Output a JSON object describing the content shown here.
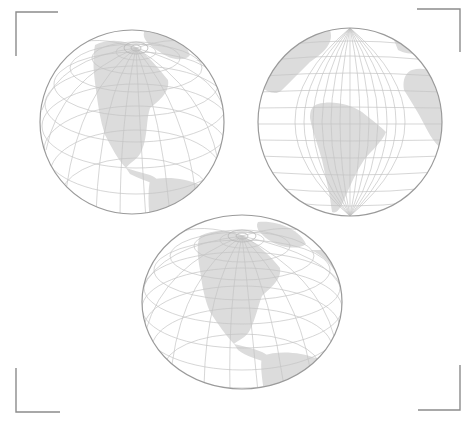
{
  "figure": {
    "colors": {
      "background": "#ffffff",
      "land": "#dcdcdc",
      "graticule": "#c4c4c4",
      "outline": "#9a9a9a",
      "crop_marks": "#8c8c8c"
    },
    "globes": [
      {
        "name": "orthographic-north-america",
        "view": "North America, north pole visible near top",
        "cx": 132,
        "cy": 122,
        "rx": 92,
        "ry": 93
      },
      {
        "name": "orthographic-south-america",
        "view": "South America centered, Africa at right edge, equatorial aspect",
        "cx": 350,
        "cy": 122,
        "rx": 92,
        "ry": 94
      },
      {
        "name": "oblate-north-america",
        "view": "North America on a flattened (oblate) globe",
        "cx": 242,
        "cy": 302,
        "rx": 100,
        "ry": 87
      }
    ],
    "crop_marks": [
      "top-left",
      "top-right",
      "bottom-left",
      "bottom-right"
    ]
  }
}
